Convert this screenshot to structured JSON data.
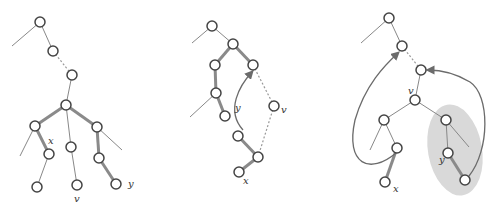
{
  "colors": {
    "node_stroke": "#444",
    "thin": "#888",
    "thick": "#8a8a8a",
    "dotted": "#999",
    "arrow": "#6b6b6b",
    "shade": "#d9d9d9"
  },
  "panels": [
    {
      "name": "panel-1",
      "nodes": [
        [
          40,
          22
        ],
        [
          53,
          51
        ],
        [
          72,
          75
        ],
        [
          66,
          105
        ],
        [
          35,
          126
        ],
        [
          97,
          127
        ],
        [
          49,
          154
        ],
        [
          71,
          147
        ],
        [
          99,
          158
        ],
        [
          37,
          187
        ],
        [
          77,
          185
        ],
        [
          116,
          184
        ]
      ],
      "thin": [
        [
          40,
          22,
          53,
          51
        ],
        [
          40,
          22,
          12,
          46
        ],
        [
          72,
          75,
          66,
          105
        ],
        [
          66,
          105,
          71,
          147
        ],
        [
          71,
          147,
          77,
          185
        ],
        [
          35,
          126,
          20,
          156
        ],
        [
          49,
          154,
          37,
          187
        ],
        [
          97,
          127,
          122,
          150
        ]
      ],
      "thick": [
        [
          66,
          105,
          35,
          126
        ],
        [
          66,
          105,
          97,
          127
        ],
        [
          35,
          126,
          49,
          154
        ],
        [
          97,
          127,
          99,
          158
        ],
        [
          99,
          158,
          116,
          184
        ]
      ],
      "dotted": [
        [
          53,
          51,
          72,
          75
        ]
      ],
      "labels": [
        {
          "t": "x",
          "x": 48,
          "y": 144
        },
        {
          "t": "v",
          "x": 74,
          "y": 202
        },
        {
          "t": "y",
          "x": 128,
          "y": 187
        }
      ]
    },
    {
      "name": "panel-2",
      "nodes": [
        [
          212,
          26
        ],
        [
          233,
          44
        ],
        [
          215,
          65
        ],
        [
          253,
          65
        ],
        [
          216,
          93
        ],
        [
          225,
          116
        ],
        [
          274,
          106
        ],
        [
          238,
          136
        ],
        [
          258,
          157
        ],
        [
          239,
          172
        ]
      ],
      "thin": [
        [
          212,
          26,
          233,
          44
        ],
        [
          212,
          26,
          192,
          43
        ],
        [
          216,
          93,
          190,
          117
        ]
      ],
      "thick": [
        [
          233,
          44,
          215,
          65
        ],
        [
          233,
          44,
          253,
          65
        ],
        [
          215,
          65,
          216,
          93
        ],
        [
          216,
          93,
          225,
          116
        ],
        [
          238,
          136,
          258,
          157
        ],
        [
          258,
          157,
          239,
          172
        ]
      ],
      "dotted": [
        [
          253,
          65,
          274,
          106
        ],
        [
          274,
          106,
          258,
          157
        ]
      ],
      "arrows": [
        "M243,130 C225,110 240,85 252,72"
      ],
      "labels": [
        {
          "t": "y",
          "x": 235,
          "y": 111
        },
        {
          "t": "v",
          "x": 281,
          "y": 113
        },
        {
          "t": "x",
          "x": 243,
          "y": 184
        }
      ]
    },
    {
      "name": "panel-3",
      "nodes": [
        [
          389,
          18
        ],
        [
          402,
          46
        ],
        [
          421,
          70
        ],
        [
          415,
          100
        ],
        [
          384,
          120
        ],
        [
          446,
          120
        ],
        [
          397,
          148
        ],
        [
          448,
          153
        ],
        [
          385,
          182
        ],
        [
          465,
          180
        ]
      ],
      "thin": [
        [
          389,
          18,
          402,
          46
        ],
        [
          389,
          18,
          361,
          43
        ],
        [
          421,
          70,
          415,
          100
        ],
        [
          415,
          100,
          384,
          120
        ],
        [
          415,
          100,
          446,
          120
        ],
        [
          384,
          120,
          370,
          150
        ],
        [
          384,
          120,
          397,
          148
        ],
        [
          446,
          120,
          448,
          153
        ],
        [
          446,
          120,
          469,
          147
        ]
      ],
      "thick": [
        [
          397,
          148,
          385,
          182
        ],
        [
          448,
          153,
          465,
          180
        ]
      ],
      "dotted": [
        [
          402,
          46,
          421,
          70
        ]
      ],
      "arrows": [
        "M396,153 C370,175 345,165 355,120 C365,85 385,65 398,53",
        "M469,176 C490,150 490,95 470,82 C455,73 440,70 428,70"
      ],
      "shade": {
        "cx": 455,
        "cy": 150,
        "rx": 27,
        "ry": 46,
        "rot": -10
      },
      "labels": [
        {
          "t": "v",
          "x": 408,
          "y": 94
        },
        {
          "t": "x",
          "x": 393,
          "y": 192
        },
        {
          "t": "y",
          "x": 439,
          "y": 163
        }
      ]
    }
  ]
}
